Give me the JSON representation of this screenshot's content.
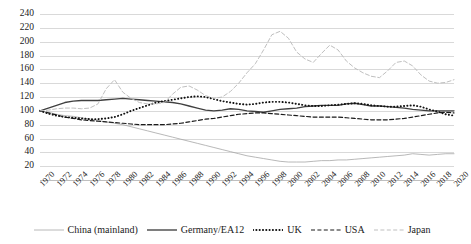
{
  "chart_data": {
    "type": "line",
    "title": "",
    "subtitle": "",
    "xlabel": "",
    "ylabel": "",
    "grid": true,
    "legend_position": "bottom",
    "xlim": [
      1970,
      2020
    ],
    "ylim": [
      0,
      240
    ],
    "y_ticks": [
      20,
      40,
      60,
      80,
      100,
      120,
      140,
      160,
      180,
      200,
      220,
      240
    ],
    "x_ticks": [
      "1970",
      "1972",
      "1974",
      "1976",
      "1978",
      "1980",
      "1982",
      "1984",
      "1986",
      "1988",
      "1990",
      "1992",
      "1994",
      "1996",
      "1998",
      "2000",
      "2002",
      "2004",
      "2006",
      "2008",
      "2010",
      "2012",
      "2014",
      "2016",
      "2018",
      "2020"
    ],
    "x": [
      1970,
      1971,
      1972,
      1973,
      1974,
      1975,
      1976,
      1977,
      1978,
      1979,
      1980,
      1981,
      1982,
      1983,
      1984,
      1985,
      1986,
      1987,
      1988,
      1989,
      1990,
      1991,
      1992,
      1993,
      1994,
      1995,
      1996,
      1997,
      1998,
      1999,
      2000,
      2001,
      2002,
      2003,
      2004,
      2005,
      2006,
      2007,
      2008,
      2009,
      2010,
      2011,
      2012,
      2013,
      2014,
      2015,
      2016,
      2017,
      2018,
      2019,
      2020
    ],
    "series": [
      {
        "name": "China (mainland)",
        "color": "#a6a6a6",
        "style": "solid-thin",
        "values": [
          100,
          98,
          95,
          93,
          92,
          90,
          88,
          86,
          84,
          82,
          80,
          77,
          74,
          71,
          68,
          65,
          62,
          59,
          56,
          53,
          50,
          47,
          44,
          41,
          38,
          35,
          33,
          31,
          29,
          27,
          26,
          26,
          26,
          27,
          28,
          28,
          29,
          29,
          30,
          31,
          32,
          33,
          34,
          35,
          36,
          38,
          37,
          36,
          37,
          38,
          38
        ]
      },
      {
        "name": "Germany/EA12",
        "color": "#404040",
        "style": "solid-bold",
        "values": [
          100,
          104,
          108,
          112,
          114,
          115,
          115,
          115,
          116,
          117,
          118,
          117,
          116,
          115,
          114,
          113,
          112,
          110,
          107,
          104,
          101,
          100,
          101,
          103,
          102,
          100,
          99,
          98,
          100,
          102,
          103,
          104,
          106,
          107,
          108,
          108,
          108,
          110,
          111,
          109,
          107,
          107,
          106,
          105,
          104,
          102,
          101,
          100,
          100,
          100,
          100
        ]
      },
      {
        "name": "UK",
        "color": "#111111",
        "style": "dotted",
        "values": [
          100,
          96,
          93,
          91,
          90,
          89,
          88,
          88,
          89,
          91,
          95,
          100,
          104,
          108,
          112,
          114,
          116,
          118,
          120,
          121,
          120,
          117,
          114,
          112,
          110,
          109,
          110,
          112,
          113,
          113,
          112,
          110,
          108,
          107,
          107,
          108,
          109,
          110,
          111,
          110,
          108,
          107,
          106,
          106,
          107,
          108,
          106,
          102,
          99,
          95,
          93
        ]
      },
      {
        "name": "USA",
        "color": "#1a1a1a",
        "style": "dashed",
        "values": [
          100,
          97,
          94,
          91,
          89,
          87,
          86,
          85,
          84,
          83,
          82,
          81,
          80,
          80,
          80,
          80,
          81,
          82,
          84,
          86,
          88,
          89,
          91,
          93,
          95,
          96,
          97,
          97,
          96,
          95,
          94,
          93,
          92,
          91,
          91,
          91,
          91,
          90,
          89,
          88,
          87,
          87,
          87,
          88,
          89,
          91,
          93,
          95,
          97,
          98,
          97
        ]
      },
      {
        "name": "Japan",
        "color": "#bfbfbf",
        "style": "dashed-thin",
        "values": [
          100,
          101,
          103,
          104,
          104,
          103,
          104,
          110,
          132,
          145,
          127,
          118,
          112,
          110,
          110,
          112,
          124,
          134,
          136,
          130,
          122,
          118,
          120,
          128,
          140,
          155,
          168,
          188,
          210,
          215,
          205,
          185,
          175,
          170,
          183,
          195,
          188,
          172,
          162,
          155,
          150,
          148,
          158,
          170,
          172,
          165,
          152,
          143,
          140,
          141,
          145
        ]
      }
    ]
  }
}
